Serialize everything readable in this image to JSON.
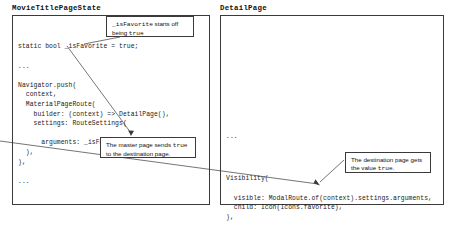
{
  "diagram": {
    "panels": [
      {
        "id": "master",
        "title": "MovieTitlePageState",
        "code": "static bool _isFavorite = true;\n\n...\n\nNavigator.push(\n  context,\n  MaterialPageRoute(\n    builder: (context) => DetailPage(),\n    settings: RouteSettings(\n\n      arguments: _isFavorite,\n  ),\n),\n\n..."
      },
      {
        "id": "detail",
        "title": "DetailPage",
        "code_top": "...",
        "code_main": "Visibility(\n\n  visible: ModalRoute.of(context).settings.arguments,\n  child: Icon(Icons.favorite),\n),"
      }
    ],
    "callouts": [
      {
        "id": "favorite",
        "parts": [
          {
            "text": "_isFavorite",
            "style": "mono"
          },
          {
            "text": " starts off being ",
            "style": "plain"
          },
          {
            "text": "true",
            "style": "mono"
          }
        ]
      },
      {
        "id": "sends",
        "parts": [
          {
            "text": "The master page sends ",
            "style": "plain"
          },
          {
            "text": "true",
            "style": "mono"
          },
          {
            "text": " to the destination page.",
            "style": "plain"
          }
        ]
      },
      {
        "id": "gets",
        "parts": [
          {
            "text": "The destination page gets the value ",
            "style": "plain"
          },
          {
            "text": "true",
            "style": "mono"
          },
          {
            "text": ".",
            "style": "plain"
          }
        ]
      }
    ],
    "connectors": [
      {
        "id": "favorite-to-declaration",
        "from": "callout-favorite",
        "to": "static-bool-line"
      },
      {
        "id": "arguments-to-callout",
        "from": "arguments-line",
        "to": "callout-sends"
      },
      {
        "id": "master-to-detail",
        "from": "callout-sends",
        "to": "visible-line"
      },
      {
        "id": "gets-to-visible",
        "from": "callout-gets",
        "to": "visible-line"
      }
    ],
    "colors": {
      "stroke": "#3a3a3a",
      "text": "#111111",
      "code": "#1a1a1a",
      "background": "#ffffff"
    }
  }
}
